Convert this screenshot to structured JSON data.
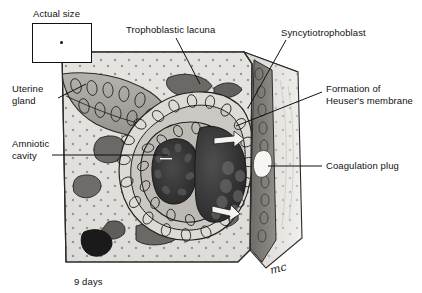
{
  "figure": {
    "caption": "9 days",
    "signature": "mc",
    "actual_size": {
      "label": "Actual size",
      "marker": "embryo-dot"
    }
  },
  "labels": [
    {
      "id": "actual-size",
      "text": "Actual size",
      "x": 33,
      "y": 8,
      "align": "left"
    },
    {
      "id": "trophoblastic-lacuna",
      "text": "Trophoblastic lacuna",
      "x": 126,
      "y": 24,
      "align": "left"
    },
    {
      "id": "syncytiotrophoblast",
      "text": "Syncytiotrophoblast",
      "x": 281,
      "y": 27,
      "align": "left"
    },
    {
      "id": "uterine-gland",
      "text": "Uterine\ngland",
      "x": 12,
      "y": 83,
      "align": "left"
    },
    {
      "id": "heusers-membrane",
      "text": "Formation of\nHeuser's membrane",
      "x": 326,
      "y": 83,
      "align": "left"
    },
    {
      "id": "amniotic-cavity",
      "text": "Amniotic\ncavity",
      "x": 12,
      "y": 138,
      "align": "left"
    },
    {
      "id": "coagulation-plug",
      "text": "Coagulation plug",
      "x": 326,
      "y": 160,
      "align": "left"
    },
    {
      "id": "day-caption",
      "text": "9 days",
      "x": 74,
      "y": 276,
      "align": "left"
    }
  ],
  "structures": [
    {
      "name": "endometrial-stroma",
      "tone": "#d8d6d2"
    },
    {
      "name": "uterine-gland",
      "tone": "#a9a6a2"
    },
    {
      "name": "trophoblastic-lacuna",
      "tone": "#6e6b68"
    },
    {
      "name": "syncytiotrophoblast",
      "tone": "#8e8b87"
    },
    {
      "name": "cytotrophoblast",
      "tone": "#cfccc8"
    },
    {
      "name": "amniotic-cavity",
      "tone": "#3a3a3a"
    },
    {
      "name": "blastocyst-cavity",
      "tone": "#2e2e2e"
    },
    {
      "name": "bilaminar-disc",
      "tone": "#bcb9b5"
    },
    {
      "name": "coagulation-plug",
      "tone": "#f2f1ee"
    },
    {
      "name": "uterine-epithelium",
      "tone": "#7d7a76"
    },
    {
      "name": "heusers-membrane",
      "tone": "#b5b2ae"
    }
  ],
  "colors": {
    "ink": "#111111",
    "paper": "#ffffff",
    "stroma_light": "#e2e0dc",
    "stroma_mid": "#cfccc8",
    "stroma_dark": "#9c9994",
    "cavity_dark": "#303030",
    "lacuna": "#6b6865"
  }
}
